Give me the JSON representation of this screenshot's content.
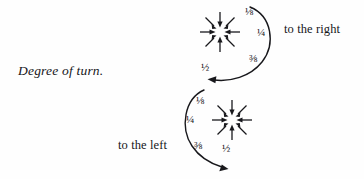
{
  "figure": {
    "caption": "Degree of turn.",
    "background_color": "#fefefe",
    "ink_color": "#18181c"
  },
  "diagrams": [
    {
      "id": "clockwise-turn",
      "direction_label": "to the right",
      "rotation": "clockwise",
      "center": {
        "x": 220,
        "y": 32
      },
      "radius": 22,
      "arrow_count": 8,
      "arrow_direction": "inward",
      "fractions": [
        {
          "value": "⅛",
          "name": "one-eighth",
          "x": 245,
          "y": 6
        },
        {
          "value": "¼",
          "name": "one-quarter",
          "x": 257,
          "y": 27
        },
        {
          "value": "⅜",
          "name": "three-eighths",
          "x": 249,
          "y": 53
        },
        {
          "value": "½",
          "name": "one-half",
          "x": 201,
          "y": 62
        }
      ],
      "curve_label_pos": {
        "x": 284,
        "y": 22
      }
    },
    {
      "id": "counterclockwise-turn",
      "direction_label": "to the left",
      "rotation": "counterclockwise",
      "center": {
        "x": 232,
        "y": 120
      },
      "radius": 22,
      "arrow_count": 8,
      "arrow_direction": "inward",
      "fractions": [
        {
          "value": "⅛",
          "name": "one-eighth",
          "x": 196,
          "y": 95
        },
        {
          "value": "¼",
          "name": "one-quarter",
          "x": 186,
          "y": 114
        },
        {
          "value": "⅜",
          "name": "three-eighths",
          "x": 194,
          "y": 140
        },
        {
          "value": "½",
          "name": "one-half",
          "x": 222,
          "y": 143
        }
      ],
      "curve_label_pos": {
        "x": 118,
        "y": 138
      }
    }
  ]
}
